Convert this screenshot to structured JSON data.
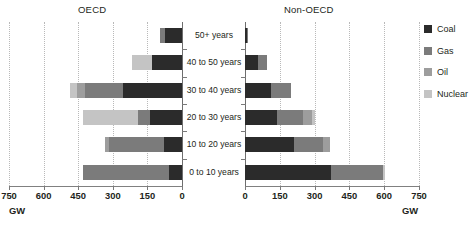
{
  "panels": {
    "left_title": "OECD",
    "right_title": "Non-OECD",
    "unit_left": "GW",
    "unit_right": "GW"
  },
  "legend": {
    "position": "right",
    "items": [
      {
        "label": "Coal",
        "color": "#2b2b2b"
      },
      {
        "label": "Gas",
        "color": "#7b7b7b"
      },
      {
        "label": "Oil",
        "color": "#9d9d9d"
      },
      {
        "label": "Nuclear",
        "color": "#c4c4c4"
      }
    ]
  },
  "axis": {
    "left_ticks": [
      "750",
      "600",
      "450",
      "300",
      "150",
      "0"
    ],
    "right_ticks": [
      "0",
      "150",
      "300",
      "450",
      "600",
      "750"
    ],
    "max": 750,
    "min": 0,
    "step": 150,
    "grid": true
  },
  "categories": [
    "50+ years",
    "40 to 50 years",
    "30 to 40 years",
    "20 to 30 years",
    "10 to 20 years",
    "0 to 10 years"
  ],
  "chart_data": {
    "type": "bar",
    "subtype": "diverging-stacked-horizontal",
    "title": "",
    "subtitle": "",
    "xlabel": "GW",
    "ylabel": "",
    "xlim": [
      0,
      750
    ],
    "grid": true,
    "legend_position": "right",
    "categories": [
      "50+ years",
      "40 to 50 years",
      "30 to 40 years",
      "20 to 30 years",
      "10 to 20 years",
      "0 to 10 years"
    ],
    "panels": [
      {
        "name": "OECD",
        "direction": "left",
        "series": [
          {
            "name": "Coal",
            "color": "#2b2b2b",
            "values": [
              75,
              130,
              255,
              140,
              80,
              55
            ]
          },
          {
            "name": "Gas",
            "color": "#7b7b7b",
            "values": [
              20,
              0,
              165,
              50,
              235,
              375
            ]
          },
          {
            "name": "Oil",
            "color": "#9d9d9d",
            "values": [
              0,
              0,
              35,
              0,
              20,
              0
            ]
          },
          {
            "name": "Nuclear",
            "color": "#c4c4c4",
            "values": [
              0,
              85,
              30,
              240,
              0,
              0
            ]
          }
        ],
        "totals": [
          95,
          215,
          485,
          430,
          335,
          430
        ]
      },
      {
        "name": "Non-OECD",
        "direction": "right",
        "series": [
          {
            "name": "Coal",
            "color": "#2b2b2b",
            "values": [
              10,
              55,
              110,
              140,
              210,
              370
            ]
          },
          {
            "name": "Gas",
            "color": "#7b7b7b",
            "values": [
              5,
              40,
              90,
              110,
              125,
              225
            ]
          },
          {
            "name": "Oil",
            "color": "#9d9d9d",
            "values": [
              0,
              0,
              0,
              40,
              30,
              0
            ]
          },
          {
            "name": "Nuclear",
            "color": "#c4c4c4",
            "values": [
              0,
              0,
              0,
              10,
              0,
              10
            ]
          }
        ],
        "totals": [
          15,
          95,
          200,
          300,
          365,
          605
        ]
      }
    ]
  }
}
